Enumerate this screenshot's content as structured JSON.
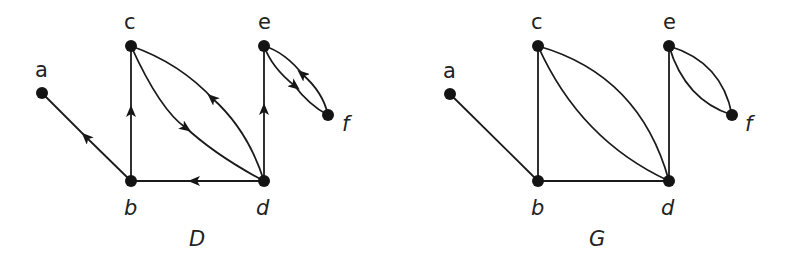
{
  "figures": [
    {
      "id": "D",
      "caption": "D",
      "kind": "directed",
      "nodes": [
        {
          "id": "a",
          "label": "a",
          "x": 42,
          "y": 93
        },
        {
          "id": "b",
          "label": "b",
          "x": 131,
          "y": 181
        },
        {
          "id": "c",
          "label": "c",
          "x": 131,
          "y": 46
        },
        {
          "id": "d",
          "label": "d",
          "x": 264,
          "y": 181
        },
        {
          "id": "e",
          "label": "e",
          "x": 264,
          "y": 46
        },
        {
          "id": "f",
          "label": "f",
          "x": 328,
          "y": 115
        }
      ],
      "edges": [
        {
          "from": "b",
          "to": "a"
        },
        {
          "from": "b",
          "to": "c"
        },
        {
          "from": "d",
          "to": "b"
        },
        {
          "from": "c",
          "to": "d",
          "curve": "lower"
        },
        {
          "from": "d",
          "to": "c",
          "curve": "upper"
        },
        {
          "from": "d",
          "to": "e"
        },
        {
          "from": "e",
          "to": "f",
          "curve": "lower"
        },
        {
          "from": "f",
          "to": "e",
          "curve": "upper"
        }
      ]
    },
    {
      "id": "G",
      "caption": "G",
      "kind": "undirected",
      "nodes": [
        {
          "id": "a",
          "label": "a",
          "x": 450,
          "y": 94
        },
        {
          "id": "b",
          "label": "b",
          "x": 538,
          "y": 181
        },
        {
          "id": "c",
          "label": "c",
          "x": 538,
          "y": 46
        },
        {
          "id": "d",
          "label": "d",
          "x": 669,
          "y": 181
        },
        {
          "id": "e",
          "label": "e",
          "x": 669,
          "y": 46
        },
        {
          "id": "f",
          "label": "f",
          "x": 732,
          "y": 115
        }
      ],
      "edges": [
        {
          "from": "a",
          "to": "b"
        },
        {
          "from": "b",
          "to": "c"
        },
        {
          "from": "b",
          "to": "d"
        },
        {
          "from": "c",
          "to": "d",
          "curve": "lower"
        },
        {
          "from": "c",
          "to": "d",
          "curve": "upper"
        },
        {
          "from": "e",
          "to": "d"
        },
        {
          "from": "e",
          "to": "f",
          "curve": "lower"
        },
        {
          "from": "e",
          "to": "f",
          "curve": "upper"
        }
      ]
    }
  ],
  "labels": {
    "D": {
      "a": "a",
      "b": "b",
      "c": "c",
      "d": "d",
      "e": "e",
      "f": "f",
      "caption": "D"
    },
    "G": {
      "a": "a",
      "b": "b",
      "c": "c",
      "d": "d",
      "e": "e",
      "f": "f",
      "caption": "G"
    }
  },
  "colors": {
    "ink": "#141414",
    "background": "#ffffff"
  }
}
